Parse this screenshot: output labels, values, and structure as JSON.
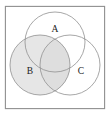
{
  "figure": {
    "type": "venn-diagram",
    "set_count": 3,
    "frame": {
      "shape": "square",
      "stroke_color": "#8f8f8f",
      "fill_color": "#ffffff",
      "x": 5,
      "y": 6,
      "width": 100,
      "height": 103
    },
    "style": {
      "circle_stroke_color": "#8f8f8f",
      "shaded_fill_color": "#e4e4e4",
      "shaded_fill_color_dark": "#dcdcdc",
      "unshaded_fill_color": "#ffffff",
      "label_color": "#1a1a1a",
      "stroke_width": 0.8
    },
    "circles": [
      {
        "label": "A",
        "name": "set-a",
        "cx": 55,
        "cy": 42,
        "r": 30,
        "shaded": false,
        "label_x": 55,
        "label_y": 30
      },
      {
        "label": "B",
        "name": "set-b",
        "cx": 40,
        "cy": 65,
        "r": 30,
        "shaded": true,
        "label_x": 30,
        "label_y": 72
      },
      {
        "label": "C",
        "name": "set-c",
        "cx": 70,
        "cy": 65,
        "r": 30,
        "shaded": false,
        "label_x": 81,
        "label_y": 72
      }
    ],
    "shaded_regions": [
      "B only",
      "A and B",
      "B and C",
      "A and B and C"
    ],
    "unshaded_regions": [
      "A only",
      "C only",
      "A and C",
      "outside all sets"
    ],
    "labels": {
      "a": "A",
      "b": "B",
      "c": "C"
    }
  }
}
